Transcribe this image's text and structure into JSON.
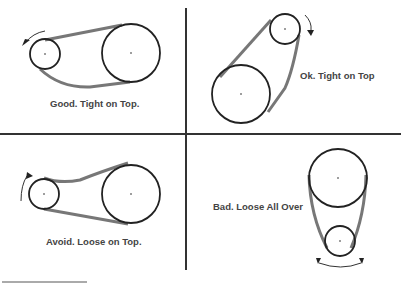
{
  "quadrants": [
    {
      "id": "top-left",
      "caption": "Good. Tight on Top.",
      "verdict": "good"
    },
    {
      "id": "top-right",
      "caption": "Ok. Tight on Top",
      "verdict": "ok"
    },
    {
      "id": "bottom-left",
      "caption": "Avoid. Loose on Top.",
      "verdict": "avoid"
    },
    {
      "id": "bottom-right",
      "caption": "Bad. Loose All Over",
      "verdict": "bad"
    }
  ],
  "colors": {
    "belt": "#777777",
    "pulley": "#222222",
    "divider": "#333333",
    "text": "#444444"
  }
}
